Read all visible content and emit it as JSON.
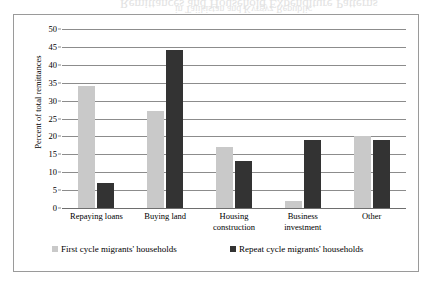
{
  "chart_data": {
    "type": "bar",
    "title": "",
    "xlabel": "",
    "ylabel": "Percent of total remittances",
    "ylim": [
      0,
      50
    ],
    "ytick_step": 5,
    "yticks": [
      50,
      45,
      40,
      35,
      30,
      25,
      20,
      15,
      10,
      5,
      0
    ],
    "grid": true,
    "legend_position": "bottom",
    "categories": [
      "Repaying loans",
      "Buying land",
      "Housing construction",
      "Business investment",
      "Other"
    ],
    "category_lines": [
      [
        "Repaying loans"
      ],
      [
        "Buying land"
      ],
      [
        "Housing",
        "construction"
      ],
      [
        "Business",
        "investment"
      ],
      [
        "Other"
      ]
    ],
    "series": [
      {
        "name": "First cycle migrants' households",
        "color": "#c9c9c9",
        "values": [
          34,
          27,
          17,
          2,
          20
        ]
      },
      {
        "name": "Repeat cycle migrants' households",
        "color": "#333333",
        "values": [
          7,
          44,
          13,
          19,
          19
        ]
      }
    ]
  },
  "legend": {
    "entries": [
      {
        "label": "First cycle migrants' households",
        "swatch_color": "#c9c9c9"
      },
      {
        "label": "Repeat cycle migrants' households",
        "swatch_color": "#333333"
      }
    ]
  },
  "colors": {
    "series_first": "#c9c9c9",
    "series_repeat": "#333333",
    "gridline": "#8c8c8c",
    "frame_border": "#9a9a9a",
    "background": "#ffffff",
    "text": "#000000"
  },
  "bleed_through": {
    "line1": "Remittances and Household Expenditure Patterns",
    "line2": "in Tajikistan and Kyrgyz Republic"
  }
}
